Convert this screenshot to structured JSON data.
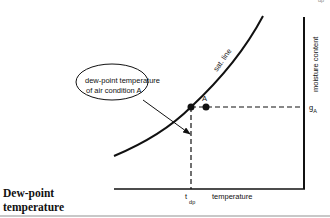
{
  "caption": {
    "line1": "Dew-point",
    "line2": "temperature"
  },
  "diagram": {
    "curve_label": "sat. line",
    "callout_line1": "dew-point temperature",
    "callout_line2": "of air condition A",
    "point_label": "A",
    "y_axis_label": "moisture content",
    "x_axis_label": "temperature",
    "y_tick_label": "g",
    "y_tick_sub": "A",
    "x_tick_label": "t",
    "x_tick_sub": "dp",
    "top_right_fragment": "dp"
  },
  "colors": {
    "line": "#111111",
    "rule": "#c8c8c8",
    "background": "#ffffff"
  }
}
